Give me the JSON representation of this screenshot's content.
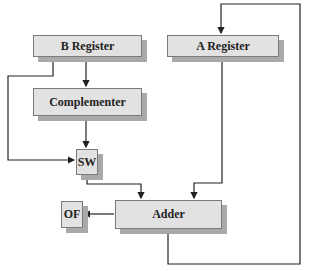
{
  "diagram": {
    "blocks": [
      {
        "id": "b-register",
        "label": "B Register"
      },
      {
        "id": "a-register",
        "label": "A Register"
      },
      {
        "id": "complementer",
        "label": "Complementer"
      },
      {
        "id": "sw",
        "label": "SW"
      },
      {
        "id": "of",
        "label": "OF"
      },
      {
        "id": "adder",
        "label": "Adder"
      }
    ],
    "connections": [
      {
        "from": "B Register",
        "to": "Complementer"
      },
      {
        "from": "B Register",
        "to": "SW"
      },
      {
        "from": "Complementer",
        "to": "SW"
      },
      {
        "from": "SW",
        "to": "Adder"
      },
      {
        "from": "A Register",
        "to": "Adder"
      },
      {
        "from": "Adder",
        "to": "OF"
      },
      {
        "from": "Adder",
        "to": "A Register"
      }
    ],
    "colors": {
      "box_fill": "#e2e2e2",
      "box_shadow": "#a9a9a9",
      "line": "#222222"
    }
  }
}
